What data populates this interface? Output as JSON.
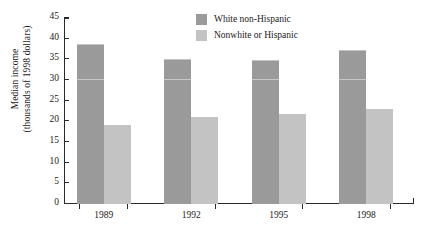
{
  "chart_data": {
    "type": "bar",
    "title": "",
    "xlabel": "",
    "ylabel": "Median income (thousands of 1998 dollars)",
    "ylabel_lines": [
      "Median income",
      "(thousands of 1998 dollars)"
    ],
    "categories": [
      "1989",
      "1992",
      "1995",
      "1998"
    ],
    "series": [
      {
        "name": "White non-Hispanic",
        "color": "#9a9a9a",
        "values": [
          38.7,
          35.1,
          34.8,
          37.2
        ]
      },
      {
        "name": "Nonwhite or Hispanic",
        "color": "#c3c3c3",
        "values": [
          19.0,
          21.1,
          21.8,
          23.0
        ]
      }
    ],
    "ylim": [
      0,
      45
    ],
    "yticks": [
      0,
      5,
      10,
      15,
      20,
      25,
      30,
      35,
      40,
      45
    ],
    "ytick_labels": [
      "0",
      "5",
      "10",
      "15",
      "20",
      "25",
      "30",
      "35",
      "40",
      "45"
    ],
    "grid": false,
    "legend_position": "top-center"
  },
  "legend": {
    "entries": [
      {
        "label": "White non-Hispanic",
        "swatch": "dark"
      },
      {
        "label": "Nonwhite or Hispanic",
        "swatch": "light"
      }
    ]
  },
  "colors": {
    "dark_gray": "#9a9a9a",
    "light_gray": "#c3c3c3",
    "axis": "#2b2b2b",
    "background": "#ffffff"
  }
}
